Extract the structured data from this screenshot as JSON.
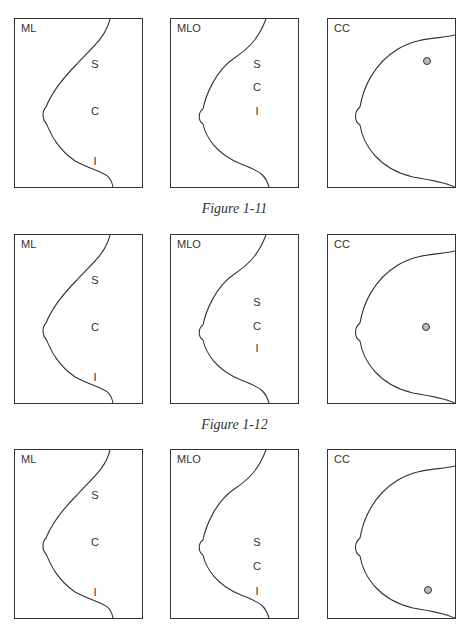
{
  "figures": [
    {
      "caption": "Figure 1-11",
      "views": [
        {
          "label": "ML",
          "zones": [
            "S",
            "C",
            "I"
          ]
        },
        {
          "label": "MLO",
          "zones": [
            "S",
            "C",
            "I"
          ]
        },
        {
          "label": "CC",
          "marker": "circle-upper"
        }
      ]
    },
    {
      "caption": "Figure 1-12",
      "views": [
        {
          "label": "ML",
          "zones": [
            "S",
            "C",
            "I"
          ]
        },
        {
          "label": "MLO",
          "zones": [
            "S",
            "C",
            "I"
          ]
        },
        {
          "label": "CC",
          "marker": "circle-middle"
        }
      ]
    },
    {
      "caption": "",
      "views": [
        {
          "label": "ML",
          "zones": [
            "S",
            "C",
            "I"
          ]
        },
        {
          "label": "MLO",
          "zones": [
            "S",
            "C",
            "I"
          ]
        },
        {
          "label": "CC",
          "marker": "circle-lower"
        }
      ]
    }
  ]
}
